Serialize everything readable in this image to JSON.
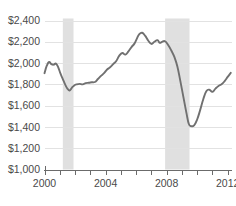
{
  "chart_data": {
    "type": "line",
    "title": "",
    "subtitle": "",
    "xlabel": "",
    "ylabel": "",
    "xlim": [
      2000.0,
      2012.25
    ],
    "ylim": [
      1000,
      2400
    ],
    "grid": true,
    "legend": "none",
    "y_ticks": [
      1000,
      1200,
      1400,
      1600,
      1800,
      2000,
      2200,
      2400
    ],
    "y_tick_labels": [
      "$1,000",
      "$1,200",
      "$1,400",
      "$1,600",
      "$1,800",
      "$2,000",
      "$2,200",
      "$2,400"
    ],
    "x_ticks": [
      2000,
      2001,
      2002,
      2003,
      2004,
      2005,
      2006,
      2007,
      2008,
      2009,
      2010,
      2011,
      2012
    ],
    "x_tick_labels_shown": [
      "2000",
      "2004",
      "2008",
      "2012"
    ],
    "x_tick_labels_shown_at": [
      2000,
      2004,
      2008,
      2012
    ],
    "line_color": "#707070",
    "grid_color": "#e2e2e2",
    "axis_color": "#6b6b6b",
    "shaded_band_color": "#e0e0e0",
    "shaded_bands": [
      {
        "label": "recession",
        "x_start": 2001.2,
        "x_end": 2001.9
      },
      {
        "label": "recession",
        "x_start": 2007.9,
        "x_end": 2009.5
      }
    ],
    "series": [
      {
        "name": "value",
        "x": [
          2000.0,
          2000.15,
          2000.3,
          2000.45,
          2000.6,
          2000.75,
          2000.9,
          2001.05,
          2001.2,
          2001.35,
          2001.5,
          2001.65,
          2001.8,
          2001.95,
          2002.1,
          2002.3,
          2002.5,
          2002.7,
          2002.9,
          2003.1,
          2003.3,
          2003.5,
          2003.7,
          2003.9,
          2004.1,
          2004.3,
          2004.5,
          2004.7,
          2004.9,
          2005.1,
          2005.3,
          2005.5,
          2005.7,
          2005.9,
          2006.05,
          2006.2,
          2006.4,
          2006.6,
          2006.8,
          2007.0,
          2007.2,
          2007.4,
          2007.55,
          2007.7,
          2007.9,
          2008.1,
          2008.3,
          2008.5,
          2008.7,
          2008.9,
          2009.1,
          2009.3,
          2009.45,
          2009.6,
          2009.8,
          2010.0,
          2010.2,
          2010.4,
          2010.6,
          2010.8,
          2011.0,
          2011.2,
          2011.4,
          2011.6,
          2011.8,
          2012.0,
          2012.2
        ],
        "y": [
          1905,
          1975,
          2010,
          1990,
          1985,
          1995,
          1960,
          1900,
          1850,
          1800,
          1760,
          1742,
          1770,
          1790,
          1800,
          1805,
          1800,
          1812,
          1815,
          1820,
          1822,
          1850,
          1880,
          1905,
          1940,
          1960,
          1990,
          2020,
          2070,
          2095,
          2080,
          2110,
          2150,
          2185,
          2230,
          2270,
          2285,
          2255,
          2210,
          2180,
          2200,
          2215,
          2190,
          2200,
          2205,
          2170,
          2120,
          2060,
          1970,
          1830,
          1680,
          1530,
          1430,
          1408,
          1415,
          1470,
          1560,
          1660,
          1735,
          1750,
          1730,
          1760,
          1785,
          1800,
          1830,
          1870,
          1908
        ]
      }
    ]
  },
  "axes": {
    "y_axis_name": "dollar-amount-axis",
    "x_axis_name": "year-axis"
  }
}
